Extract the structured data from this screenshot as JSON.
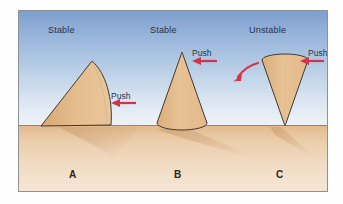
{
  "figure": {
    "frame_border_color": "#8e9297",
    "sky_top_color": "#7d9fce",
    "sky_bottom_color": "#eef2f7",
    "ground_top_color": "#e3b98c",
    "ground_bottom_color": "#f5e6d5",
    "cone_fill_color": "#e0b383",
    "cone_outline_color": "#3a3a3a",
    "arrow_color": "#d2334a",
    "label_text_color": "#23344d",
    "letter_text_color": "#2a2620",
    "horizon_line_color": "#6f7479"
  },
  "panels": [
    {
      "id": "a",
      "letter": "A",
      "state_label": "Stable",
      "push_label": "Push",
      "arrow_direction": "left",
      "arrow_kind": "straight",
      "description": "Cone lying on its side"
    },
    {
      "id": "b",
      "letter": "B",
      "state_label": "Stable",
      "push_label": "Push",
      "arrow_direction": "left",
      "arrow_kind": "straight",
      "description": "Cone standing upright on its circular base"
    },
    {
      "id": "c",
      "letter": "C",
      "state_label": "Unstable",
      "push_label": "Push",
      "arrow_direction": "left",
      "arrow_kind": "straight",
      "tip_arrow_kind": "curved",
      "tip_arrow_direction": "down-left",
      "description": "Inverted cone balanced on its point"
    }
  ]
}
